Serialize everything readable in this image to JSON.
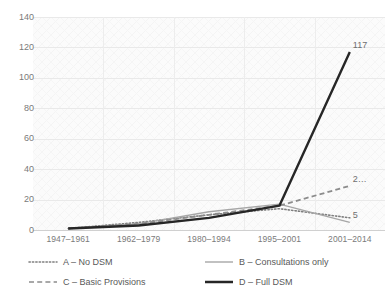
{
  "figure": {
    "clipped_header": "",
    "background": "#ffffff",
    "plot_background": "#fbfbfb"
  },
  "chart_data": {
    "type": "line",
    "title": "",
    "subtitle": "",
    "xlabel": "",
    "ylabel": "",
    "categories": [
      "1947–1961",
      "1962–1979",
      "1980–1994",
      "1995–2001",
      "2001–2014"
    ],
    "ylim": [
      0,
      140
    ],
    "yticks": [
      0,
      20,
      40,
      60,
      80,
      100,
      120,
      140
    ],
    "ytick_labels": [
      "0",
      "20",
      "40",
      "60",
      "80",
      "100",
      "120",
      "140"
    ],
    "grid": true,
    "legend_position": "bottom",
    "series": [
      {
        "name": "A – No DSM",
        "key": "A",
        "label": "A – No DSM",
        "style": "dotted",
        "color": "#7f7f7f",
        "width": 1.6,
        "values": [
          1,
          5,
          10,
          14,
          8
        ],
        "end_label": ""
      },
      {
        "name": "B – Consultations only",
        "key": "B",
        "label": "B – Consultations only",
        "style": "solid-thin",
        "color": "#a6a6a6",
        "width": 1.4,
        "values": [
          1,
          4,
          12,
          17,
          5
        ],
        "end_label": "5"
      },
      {
        "name": "C – Basic Provisions",
        "key": "C",
        "label": "C – Basic Provisions",
        "style": "dashed",
        "color": "#8c8c8c",
        "width": 1.8,
        "values": [
          1,
          4,
          10,
          16,
          29
        ],
        "end_label": "2…"
      },
      {
        "name": "D – Full DSM",
        "key": "D",
        "label": "D – Full DSM",
        "style": "solid-thick",
        "color": "#262626",
        "width": 2.4,
        "values": [
          1,
          3,
          8,
          16,
          117
        ],
        "end_label": "117"
      }
    ],
    "data_labels": [
      {
        "series": "D",
        "text": "117",
        "value": 117
      },
      {
        "series": "C",
        "text": "2…",
        "value": 29
      },
      {
        "series": "B",
        "text": "5",
        "value": 5
      }
    ]
  },
  "legend": {
    "row1": [
      {
        "label": "A – No DSM",
        "style": "dotted"
      },
      {
        "label": "B – Consultations only",
        "style": "solid-thin"
      }
    ],
    "row2": [
      {
        "label": "C – Basic Provisions",
        "style": "dashed"
      },
      {
        "label": "D – Full DSM",
        "style": "solid-thick"
      }
    ]
  }
}
